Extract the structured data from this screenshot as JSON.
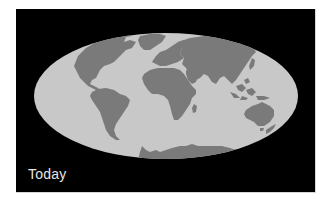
{
  "map": {
    "projection": "Mollweide",
    "era_label": "Today",
    "colors": {
      "background": "#000000",
      "ocean": "#c8c8c8",
      "land": "#7a7a7a",
      "label": "#e6e6e6"
    },
    "continents": [
      "North America",
      "Greenland",
      "South America",
      "Europe",
      "Africa",
      "Madagascar",
      "Asia",
      "Southeast Asia",
      "Australia",
      "New Zealand",
      "Antarctica"
    ]
  }
}
